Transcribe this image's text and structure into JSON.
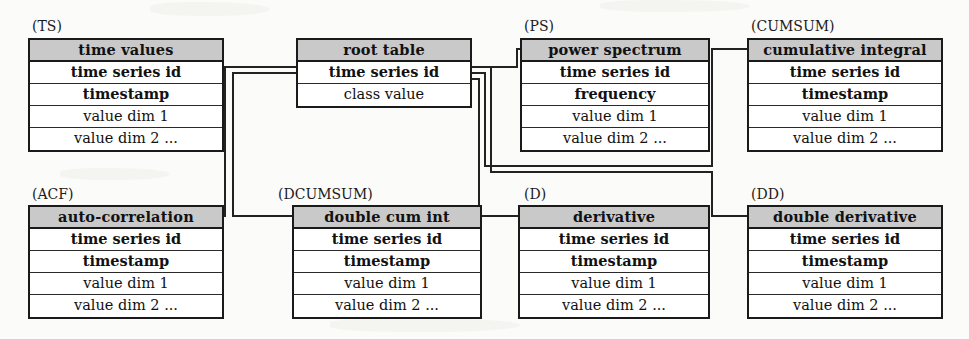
{
  "diagram": {
    "type": "entity-relationship-schema",
    "accent_header_fill": "#c9c9c9",
    "line_color": "#222222",
    "background": "#fbfbf9"
  },
  "tables": [
    {
      "id": "TS",
      "caption": "(TS)",
      "title": "time values",
      "fields": [
        {
          "label": "time series id",
          "kind": "key"
        },
        {
          "label": "timestamp",
          "kind": "key"
        },
        {
          "label": "value dim 1",
          "kind": "attr"
        },
        {
          "label": "value dim 2 ...",
          "kind": "attr"
        }
      ]
    },
    {
      "id": "ROOT",
      "caption": "",
      "title": "root table",
      "fields": [
        {
          "label": "time series id",
          "kind": "key"
        },
        {
          "label": "class value",
          "kind": "attr"
        }
      ]
    },
    {
      "id": "PS",
      "caption": "(PS)",
      "title": "power spectrum",
      "fields": [
        {
          "label": "time series id",
          "kind": "key"
        },
        {
          "label": "frequency",
          "kind": "key"
        },
        {
          "label": "value dim 1",
          "kind": "attr"
        },
        {
          "label": "value dim 2 ...",
          "kind": "attr"
        }
      ]
    },
    {
      "id": "CUMSUM",
      "caption": "(CUMSUM)",
      "title": "cumulative integral",
      "fields": [
        {
          "label": "time series id",
          "kind": "key"
        },
        {
          "label": "timestamp",
          "kind": "key"
        },
        {
          "label": "value dim 1",
          "kind": "attr"
        },
        {
          "label": "value dim 2 ...",
          "kind": "attr"
        }
      ]
    },
    {
      "id": "ACF",
      "caption": "(ACF)",
      "title": "auto-correlation",
      "fields": [
        {
          "label": "time series id",
          "kind": "key"
        },
        {
          "label": "timestamp",
          "kind": "key"
        },
        {
          "label": "value dim 1",
          "kind": "attr"
        },
        {
          "label": "value dim 2 ...",
          "kind": "attr"
        }
      ]
    },
    {
      "id": "DCUMSUM",
      "caption": "(DCUMSUM)",
      "title": "double cum int",
      "fields": [
        {
          "label": "time series id",
          "kind": "key"
        },
        {
          "label": "timestamp",
          "kind": "key"
        },
        {
          "label": "value dim 1",
          "kind": "attr"
        },
        {
          "label": "value dim 2 ...",
          "kind": "attr"
        }
      ]
    },
    {
      "id": "D",
      "caption": "(D)",
      "title": "derivative",
      "fields": [
        {
          "label": "time series id",
          "kind": "key"
        },
        {
          "label": "timestamp",
          "kind": "key"
        },
        {
          "label": "value dim 1",
          "kind": "attr"
        },
        {
          "label": "value dim 2 ...",
          "kind": "attr"
        }
      ]
    },
    {
      "id": "DD",
      "caption": "(DD)",
      "title": "double derivative",
      "fields": [
        {
          "label": "time series id",
          "kind": "key"
        },
        {
          "label": "timestamp",
          "kind": "key"
        },
        {
          "label": "value dim 1",
          "kind": "attr"
        },
        {
          "label": "value dim 2 ...",
          "kind": "attr"
        }
      ]
    }
  ],
  "relationships": [
    {
      "from": "ROOT",
      "to": "TS"
    },
    {
      "from": "ROOT",
      "to": "ACF"
    },
    {
      "from": "ROOT",
      "to": "DCUMSUM"
    },
    {
      "from": "ROOT",
      "to": "PS"
    },
    {
      "from": "ROOT",
      "to": "CUMSUM"
    },
    {
      "from": "ROOT",
      "to": "D"
    },
    {
      "from": "ROOT",
      "to": "DD"
    }
  ]
}
